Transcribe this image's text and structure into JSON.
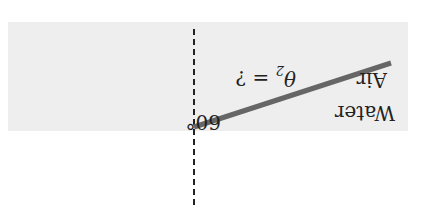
{
  "diagram": {
    "type": "refraction",
    "orientation": "rotated-180",
    "media": {
      "upper": "Air",
      "lower": "Water"
    },
    "incident_angle_label": "60°",
    "refracted_angle_label": "θ₂ = ?",
    "refracted_angle_symbol": "θ",
    "refracted_angle_subscript": "2",
    "refracted_angle_suffix": " = ?",
    "colors": {
      "water_fill": "#eeeeee",
      "ray": "#666666",
      "normal_line": "#222222",
      "text": "#222222"
    }
  }
}
